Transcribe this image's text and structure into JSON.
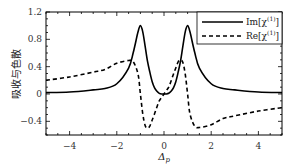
{
  "chart_data": {
    "type": "line",
    "title": "",
    "xlabel": "Δp",
    "ylabel": "吸收与色散",
    "xlim": [
      -5,
      5
    ],
    "ylim": [
      -0.6,
      1.2
    ],
    "xticks": [
      -4,
      -2,
      0,
      2,
      4
    ],
    "xtick_labels": [
      "−4",
      "−2",
      "0",
      "2",
      "4"
    ],
    "yticks": [
      -0.4,
      0,
      0.4,
      0.8,
      1.2
    ],
    "ytick_labels": [
      "−0.4",
      "0",
      "0.4",
      "0.8",
      "1.2"
    ],
    "grid": false,
    "legend_position": "upper right",
    "x": [
      -5,
      -4,
      -3,
      -2.5,
      -2,
      -1.5,
      -1.3,
      -1.1,
      -1.0,
      -0.9,
      -0.8,
      -0.7,
      -0.6,
      -0.5,
      -0.4,
      -0.3,
      -0.2,
      -0.1,
      0,
      0.1,
      0.2,
      0.3,
      0.4,
      0.5,
      0.6,
      0.7,
      0.8,
      0.9,
      1.0,
      1.1,
      1.3,
      1.5,
      2,
      2.5,
      3,
      4,
      5
    ],
    "series": [
      {
        "name": "Im[χ(1)]",
        "style": "solid",
        "color": "#000000",
        "values": [
          0.02,
          0.03,
          0.06,
          0.08,
          0.15,
          0.38,
          0.61,
          0.91,
          1.0,
          0.91,
          0.7,
          0.48,
          0.32,
          0.18,
          0.09,
          0.04,
          0.01,
          0.0,
          0.0,
          0.0,
          0.01,
          0.04,
          0.09,
          0.18,
          0.32,
          0.48,
          0.7,
          0.91,
          1.0,
          0.91,
          0.61,
          0.38,
          0.15,
          0.08,
          0.06,
          0.03,
          0.02
        ]
      },
      {
        "name": "Re[χ(1)]",
        "style": "dashed",
        "color": "#000000",
        "values": [
          0.2,
          0.25,
          0.32,
          0.36,
          0.45,
          0.49,
          0.47,
          0.29,
          0.0,
          -0.29,
          -0.46,
          -0.5,
          -0.47,
          -0.38,
          -0.29,
          -0.19,
          -0.1,
          -0.05,
          0.0,
          0.05,
          0.1,
          0.19,
          0.29,
          0.38,
          0.47,
          0.5,
          0.46,
          0.29,
          0.0,
          -0.29,
          -0.47,
          -0.49,
          -0.45,
          -0.36,
          -0.32,
          -0.25,
          -0.2
        ]
      }
    ]
  },
  "legend": {
    "items": [
      {
        "label": "Im[χ",
        "sup": "(1)",
        "tail": "]",
        "style": "solid"
      },
      {
        "label": "Re[χ",
        "sup": "(1)",
        "tail": "]",
        "style": "dashed"
      }
    ]
  }
}
